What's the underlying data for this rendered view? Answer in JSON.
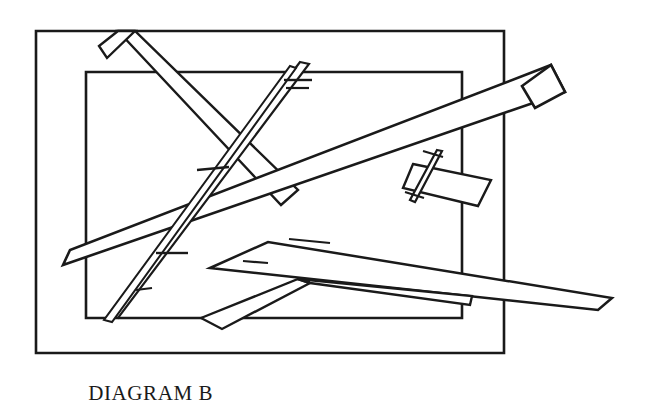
{
  "figure": {
    "caption": "DIAGRAM B",
    "background_color": "#ffffff",
    "stroke_color": "#1a1a1a",
    "title_font_style": "serif-small-caps",
    "canvas": {
      "width": 663,
      "height": 407
    }
  },
  "shapes": {
    "outer_rectangle": {
      "name": "outer-frame",
      "points": "36,31 504,31 504,353 36,353",
      "stroke_width": 2.6,
      "closed": true
    },
    "inner_rectangle": {
      "name": "inner-frame",
      "points": "86,72 462,72 462,318 86,318",
      "stroke_width": 2.6,
      "closed": true
    },
    "bars": [
      {
        "id": "bar-upper-left-long",
        "label": "long bar from upper-left sloping down to the right",
        "points": "118,31 135,31 298,190 281,205",
        "stroke_width": 2.4,
        "closed": true
      },
      {
        "id": "bar-upper-left-head",
        "label": "angled head block at top-left of long bar",
        "points": "118,31 135,31 107,58 99,46",
        "stroke_width": 2.4,
        "closed": true
      },
      {
        "id": "bar-main-diagonal",
        "label": "longest diagonal bar running lower-left to upper-right",
        "points": "63,265 70,250 551,65 565,92",
        "stroke_width": 2.6,
        "closed": true
      },
      {
        "id": "bar-main-diagonal-cap",
        "label": "blunt end cap of main diagonal bar at upper right",
        "points": "551,65 565,92 535,108 522,86",
        "stroke_width": 2.6,
        "closed": true
      },
      {
        "id": "bar-small-tilted-right",
        "label": "small tilted rectangle right of center",
        "points": "413,164 491,180 478,206 403,188",
        "stroke_width": 2.4,
        "closed": true
      },
      {
        "id": "sliver-right",
        "label": "thin sliver crossing the small tilted rectangle",
        "points": "437,150 442,151 415,202 410,200",
        "stroke_width": 2.2,
        "closed": true
      },
      {
        "id": "needle-center",
        "label": "long thin needle running from top center down to lower left",
        "points": "300,62 309,64 118,318 109,314",
        "stroke_width": 2.2,
        "closed": true
      },
      {
        "id": "needle-center-second",
        "label": "second thin needle parallel and left of the center needle",
        "points": "290,66 296,68 112,322 104,320",
        "stroke_width": 2.0,
        "closed": true
      },
      {
        "id": "bar-lower-long-taper",
        "label": "long tapering bar from lower-left to far right tip",
        "points": "210,268 268,242 612,298 598,310",
        "stroke_width": 2.5,
        "closed": true
      },
      {
        "id": "chevron-lower",
        "label": "bent chevron shape in lower middle",
        "points": "201,318 298,279 310,283 222,329",
        "stroke_width": 2.4,
        "closed": true
      },
      {
        "id": "chevron-lower-arm",
        "label": "right arm of the lower chevron",
        "points": "298,279 472,296 470,305 310,283",
        "stroke_width": 2.4,
        "closed": true
      }
    ],
    "tick_marks": [
      {
        "id": "tick-upper-center-1",
        "x1": 284,
        "y1": 80,
        "x2": 312,
        "y2": 80,
        "stroke_width": 2.4
      },
      {
        "id": "tick-upper-center-2",
        "x1": 286,
        "y1": 88,
        "x2": 309,
        "y2": 88,
        "stroke_width": 2.2
      },
      {
        "id": "tick-left-mid",
        "x1": 197,
        "y1": 170,
        "x2": 229,
        "y2": 167,
        "stroke_width": 2.4
      },
      {
        "id": "tick-center-low",
        "x1": 156,
        "y1": 253,
        "x2": 188,
        "y2": 253,
        "stroke_width": 2.4
      },
      {
        "id": "tick-center-low-2",
        "x1": 136,
        "y1": 290,
        "x2": 152,
        "y2": 288,
        "stroke_width": 2.2
      },
      {
        "id": "tick-right-sliver-1",
        "x1": 423,
        "y1": 151,
        "x2": 443,
        "y2": 157,
        "stroke_width": 2.2
      },
      {
        "id": "tick-right-sliver-2",
        "x1": 405,
        "y1": 192,
        "x2": 424,
        "y2": 198,
        "stroke_width": 2.2
      },
      {
        "id": "tick-lower-chevron-1",
        "x1": 289,
        "y1": 239,
        "x2": 330,
        "y2": 243,
        "stroke_width": 2.2
      },
      {
        "id": "tick-lower-chevron-2",
        "x1": 243,
        "y1": 261,
        "x2": 268,
        "y2": 263,
        "stroke_width": 2.2
      }
    ]
  }
}
